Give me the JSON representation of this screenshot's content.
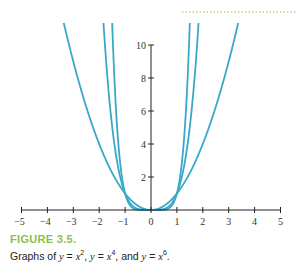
{
  "chart_data": {
    "type": "line",
    "title": "",
    "xlabel": "",
    "ylabel": "",
    "xlim": [
      -5,
      5
    ],
    "ylim": [
      0,
      10
    ],
    "x_ticks": [
      -5,
      -4,
      -3,
      -2,
      -1,
      0,
      1,
      2,
      3,
      4,
      5
    ],
    "y_ticks": [
      2,
      4,
      6,
      8,
      10
    ],
    "grid": false,
    "legend": "none",
    "series": [
      {
        "name": "y = x^2",
        "function": "x^2",
        "points": [
          [
            -3,
            9
          ],
          [
            -2,
            4
          ],
          [
            -1,
            1
          ],
          [
            0,
            0
          ],
          [
            1,
            1
          ],
          [
            2,
            4
          ],
          [
            3,
            9
          ]
        ]
      },
      {
        "name": "y = x^4",
        "function": "x^4",
        "points": [
          [
            -1.75,
            9.38
          ],
          [
            -1.5,
            5.06
          ],
          [
            -1,
            1
          ],
          [
            0,
            0
          ],
          [
            1,
            1
          ],
          [
            1.5,
            5.06
          ],
          [
            1.75,
            9.38
          ]
        ]
      },
      {
        "name": "y = x^6",
        "function": "x^6",
        "points": [
          [
            -1.45,
            9.27
          ],
          [
            -1.25,
            3.81
          ],
          [
            -1,
            1
          ],
          [
            0,
            0
          ],
          [
            1,
            1
          ],
          [
            1.25,
            3.81
          ],
          [
            1.45,
            9.27
          ]
        ]
      }
    ],
    "curve_color": "#3aa8c8",
    "axis_color": "#222222"
  },
  "caption": {
    "label": "FIGURE 3.5.",
    "text_prefix": "Graphs of ",
    "label_color": "#8cc04a"
  },
  "decoration": {
    "dotted_rule_color": "#b5d88a"
  }
}
